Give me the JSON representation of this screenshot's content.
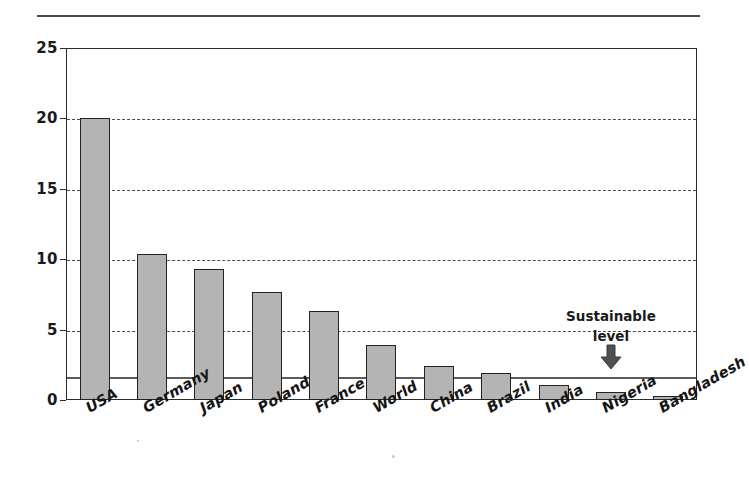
{
  "figure": {
    "background_color": "#fefefe",
    "bar_fill_color": "#b4b4b4",
    "bar_edge_color": "#232323",
    "gridline_color": "#4d4d4d",
    "axis_color": "#2b2b2b",
    "sustainable_line_color": "#5c5c5c"
  },
  "annotations": {
    "sustainable_label_line1": "Sustainable",
    "sustainable_label_line2": "level",
    "arrow_icon": "down-arrow"
  },
  "chart_data": {
    "type": "bar",
    "title": "",
    "xlabel": "",
    "ylabel": "",
    "ylim": [
      0,
      25
    ],
    "yticks": [
      0,
      5,
      10,
      15,
      20,
      25
    ],
    "ytick_labels": [
      "0",
      "5",
      "10",
      "15",
      "20",
      "25"
    ],
    "grid": true,
    "grid_axis": "y",
    "gridline_style": "dashed",
    "legend": false,
    "categories": [
      "USA",
      "Germany",
      "Japan",
      "Poland",
      "France",
      "World",
      "China",
      "Brazil",
      "India",
      "Nigeria",
      "Bangladesh"
    ],
    "values": [
      20.0,
      10.4,
      9.3,
      7.7,
      6.3,
      3.9,
      2.4,
      1.9,
      1.1,
      0.6,
      0.3
    ],
    "reference_line": {
      "label": "Sustainable level",
      "value": 1.7,
      "style": "solid"
    }
  }
}
